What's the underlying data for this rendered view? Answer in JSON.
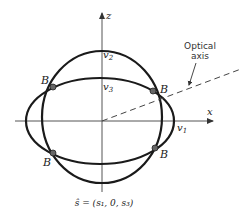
{
  "figure": {
    "axes": {
      "x_label": "x",
      "z_label": "z"
    },
    "curves": {
      "outer_label": "v",
      "outer_subscript": "2",
      "inner_label": "v",
      "inner_subscript": "3",
      "x_intercept_label": "v",
      "x_intercept_subscript": "1"
    },
    "binormal_points": {
      "label": "B",
      "count": 4
    },
    "optical_axis": {
      "line1": "Optical",
      "line2": "axis"
    },
    "caption": "ŝ = (s₁, 0, s₃)"
  }
}
